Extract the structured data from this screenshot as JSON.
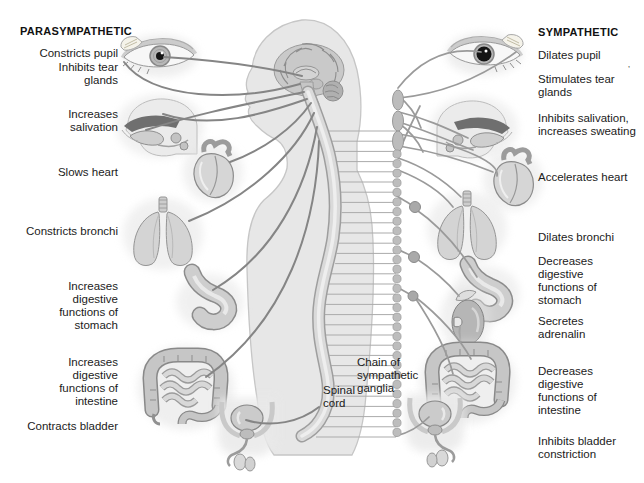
{
  "parasympathetic": {
    "heading": "PARASYMPATHETIC",
    "labels": [
      "Constricts pupil",
      "Inhibits tear glands",
      "Increases salivation",
      "Slows heart",
      "Constricts bronchi",
      "Increases digestive functions of stomach",
      "Increases digestive functions of intestine",
      "Contracts bladder"
    ]
  },
  "sympathetic": {
    "heading": "SYMPATHETIC",
    "labels": [
      "Dilates pupil",
      "Stimulates tear glands",
      "Inhibits salivation, increases sweating",
      "Accelerates heart",
      "Dilates bronchi",
      "Decreases digestive functions of stomach",
      "Secretes adrenalin",
      "Decreases digestive functions of intestine",
      "Inhibits bladder constriction"
    ]
  },
  "center": {
    "chain_label": "Chain of sympathetic ganglia",
    "spinal_cord_label": "Spinal cord"
  },
  "artifact_mark": "’",
  "colors": {
    "background": "#ffffff",
    "text": "#1b1b1b",
    "body_fill": "#e7e7e7",
    "organ_fill": "#d2d2d2",
    "nerve_parasympathetic": "#858585",
    "nerve_sympathetic": "#9a9a9a",
    "ganglia_fill": "#bdbdbd"
  },
  "icons": {
    "left_column": [
      "eye-constricted-pupil-icon",
      "salivary-glands-head-icon",
      "heart-icon",
      "lungs-icon",
      "stomach-icon",
      "large-intestine-icon",
      "bladder-pelvis-icon"
    ],
    "right_column": [
      "eye-dilated-pupil-icon",
      "salivary-glands-head-icon",
      "heart-icon",
      "lungs-icon",
      "stomach-icon",
      "kidney-adrenal-icon",
      "large-intestine-icon",
      "bladder-pelvis-icon"
    ],
    "center": [
      "human-body-profile",
      "brain-icon",
      "spinal-cord",
      "sympathetic-ganglia-chain",
      "spinal-nerves"
    ]
  }
}
